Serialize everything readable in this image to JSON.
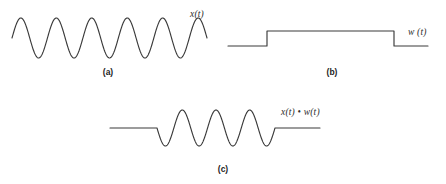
{
  "figure": {
    "background_color": "#ffffff",
    "curve_color": "#3a3a3a",
    "text_color": "#1d1d1d"
  },
  "panels": [
    {
      "id": "a",
      "caption": "(a)",
      "signal_label": "x(t)",
      "description": "continuous sinusoid"
    },
    {
      "id": "b",
      "caption": "(b)",
      "signal_label": "w (t)",
      "description": "rectangular window"
    },
    {
      "id": "c",
      "caption": "(c)",
      "signal_label": "x(t) • w(t)",
      "description": "windowed signal"
    }
  ],
  "chart_data": [
    {
      "type": "line",
      "id": "a",
      "title": "x(t)",
      "xlabel": "",
      "ylabel": "",
      "grid": false,
      "legend": "none",
      "xlim": [
        0,
        223
      ],
      "ylim": [
        -1.2,
        1.2
      ],
      "waveform": "sine",
      "cycles": 5.5,
      "amplitude": 1.0,
      "phase_deg": 180,
      "x_start": 12,
      "x_end": 207,
      "baseline_y": 32,
      "peak_height": 20
    },
    {
      "type": "line",
      "id": "b",
      "title": "w (t)",
      "xlabel": "",
      "ylabel": "",
      "grid": false,
      "legend": "none",
      "xlim": [
        0,
        223
      ],
      "ylim": [
        -0.2,
        1.2
      ],
      "waveform": "rectangular-window",
      "x_start": 5,
      "rise_x": 44,
      "fall_x": 171,
      "x_end": 205,
      "low_level": 0,
      "high_level": 1,
      "low_y": 40,
      "high_y": 25
    },
    {
      "type": "line",
      "id": "c",
      "title": "x(t) • w(t)",
      "xlabel": "",
      "ylabel": "",
      "grid": false,
      "legend": "none",
      "xlim": [
        0,
        250
      ],
      "ylim": [
        -1.2,
        1.2
      ],
      "waveform": "windowed-sine",
      "cycles": 3.5,
      "amplitude": 1.0,
      "x_start": 10,
      "wave_start": 57,
      "wave_end": 175,
      "x_end": 220,
      "baseline_y": 28,
      "peak_height": 18
    }
  ]
}
